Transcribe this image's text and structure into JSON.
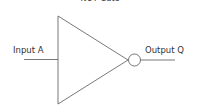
{
  "diagram": {
    "title": "NOT Gate",
    "input_label": "Input A",
    "output_label": "Output Q",
    "gate_type": "NOT",
    "colors": {
      "stroke": "#555555",
      "text": "#333333",
      "background": "#ffffff"
    }
  }
}
